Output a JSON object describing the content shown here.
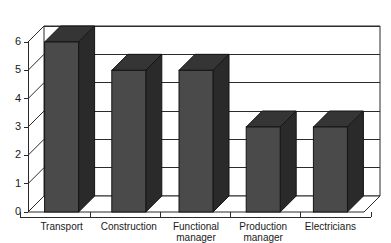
{
  "chart_data": {
    "type": "bar",
    "title": "",
    "subtitle": "",
    "xlabel": "",
    "ylabel": "",
    "categories": [
      "Transport",
      "Construction",
      "Functional manager",
      "Production manager",
      "Electricians"
    ],
    "values": [
      6,
      5,
      5,
      3,
      3
    ],
    "series": [
      {
        "name": "",
        "values": [
          6,
          5,
          5,
          3,
          3
        ]
      }
    ],
    "ylim": [
      0,
      6
    ],
    "ytick_labels": [
      "0",
      "1",
      "2",
      "3",
      "4",
      "5",
      "6"
    ],
    "ytick_values": [
      0,
      1,
      2,
      3,
      4,
      5,
      6
    ],
    "grid": true,
    "grid_orientation": "horizontal",
    "legend": false,
    "legend_position": "none",
    "style": "3d-column",
    "colors": {
      "bar_front": "#4a4a4a",
      "bar_side": "#2a2a2a",
      "bar_top": "#353535",
      "bar_outline": "#141414",
      "axis": "#2b2b2b",
      "grid": "#2b2b2b",
      "plot_background": "#ffffff",
      "page_background": "#ffffff",
      "text": "#1a1a1a"
    }
  },
  "category_label_lines": [
    [
      "Transport"
    ],
    [
      "Construction"
    ],
    [
      "Functional",
      "manager"
    ],
    [
      "Production",
      "manager"
    ],
    [
      "Electricians"
    ]
  ]
}
